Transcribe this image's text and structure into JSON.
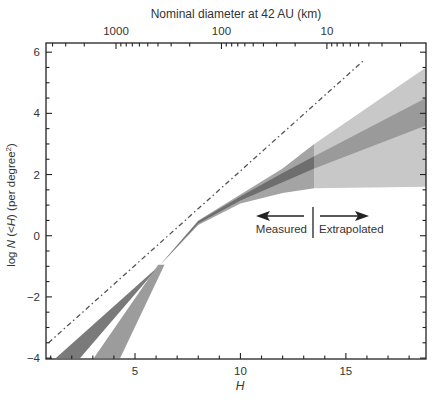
{
  "chart_data": {
    "type": "area",
    "title": "",
    "xlabel": "H",
    "ylabel": "log N (<H) (per degree²)",
    "ylabel_parts": [
      "log ",
      "N",
      " (<",
      "H",
      ") (per degree",
      "2",
      ")"
    ],
    "top_axis_label": "Nominal diameter at 42 AU (km)",
    "xlim": [
      0.78,
      18.8
    ],
    "ylim": [
      -4.03,
      6.3
    ],
    "x_ticks": [
      5,
      10,
      15
    ],
    "x_tick_labels": [
      "5",
      "10",
      "15"
    ],
    "y_ticks": [
      -4,
      -2,
      0,
      2,
      4,
      6
    ],
    "y_tick_labels": [
      "−4",
      "−2",
      "0",
      "2",
      "4",
      "6"
    ],
    "top_ticks_km": [
      1000,
      100,
      10
    ],
    "top_tick_labels": [
      "1000",
      "100",
      "10"
    ],
    "top_tick_H": [
      4.1,
      9.1,
      14.2
    ],
    "grid": false,
    "annotations": {
      "measured_label": "Measured",
      "extrapolated_label": "Extrapolated",
      "divider_H": 13.5
    },
    "series": [
      {
        "name": "Reference power law (dash-dot)",
        "style": "dash-dot",
        "x": [
          0.9,
          15.8
        ],
        "y": [
          -3.5,
          5.7
        ]
      },
      {
        "name": "Extrapolated envelope (light)",
        "style": "fill",
        "color": "#c8c8c8",
        "x": [
          13.5,
          18.8,
          18.8,
          13.5
        ],
        "y": [
          3.0,
          5.5,
          1.6,
          1.55
        ]
      },
      {
        "name": "Extrapolated best fit (medium)",
        "style": "fill",
        "color": "#9a9a9a",
        "x": [
          13.5,
          18.8,
          18.8,
          13.5
        ],
        "y": [
          2.6,
          4.5,
          3.6,
          2.2
        ]
      },
      {
        "name": "Measured envelope (medium)",
        "style": "fill",
        "color": "#a4a4a4",
        "upper": {
          "x": [
            6.2,
            8,
            10,
            12,
            13.5
          ],
          "y": [
            -0.95,
            0.5,
            1.35,
            2.2,
            3.0
          ]
        },
        "lower": {
          "x": [
            6.2,
            8,
            10,
            12,
            13.5
          ],
          "y": [
            -0.95,
            0.35,
            1.05,
            1.4,
            1.55
          ]
        }
      },
      {
        "name": "Measured best fit (dark)",
        "style": "fill",
        "color": "#6e6e6e",
        "upper": {
          "x": [
            6.2,
            8,
            10,
            12,
            13.5
          ],
          "y": [
            -0.95,
            0.47,
            1.28,
            2.05,
            2.6
          ]
        },
        "lower": {
          "x": [
            6.2,
            8,
            10,
            12,
            13.5
          ],
          "y": [
            -0.95,
            0.4,
            1.15,
            1.75,
            2.2
          ]
        }
      },
      {
        "name": "Bright-end branch (dark)",
        "style": "fill",
        "color": "#7a7a7a",
        "x": [
          1.25,
          2.4,
          6.2,
          6.2
        ],
        "y": [
          -4.0,
          -4.0,
          -0.95,
          -0.95
        ]
      },
      {
        "name": "Bright-end branch (light)",
        "style": "fill",
        "color": "#9c9c9c",
        "x": [
          3.05,
          4.3,
          6.4,
          6.1
        ],
        "y": [
          -4.0,
          -4.0,
          -0.95,
          -0.95
        ]
      }
    ]
  }
}
